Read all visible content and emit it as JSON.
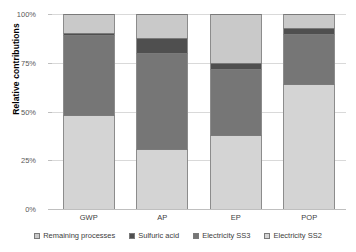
{
  "chart_data": {
    "type": "bar",
    "subtype": "stacked-100-percent",
    "title": "",
    "xlabel": "",
    "ylabel": "Relative contributions",
    "categories": [
      "GWP",
      "AP",
      "EP",
      "POP"
    ],
    "ylim": [
      0,
      100
    ],
    "y_tick_labels": [
      "0%",
      "25%",
      "50%",
      "75%",
      "100%"
    ],
    "y_tick_values": [
      0,
      25,
      50,
      75,
      100
    ],
    "grid": true,
    "legend_position": "bottom",
    "stack_order_bottom_to_top": [
      "Electricity SS2",
      "Electricity SS3",
      "Sulfuric acid",
      "Remaining processes"
    ],
    "series": [
      {
        "name": "Electricity SS2",
        "color": "#d4d4d4",
        "values": [
          48,
          31,
          38,
          64
        ]
      },
      {
        "name": "Electricity SS3",
        "color": "#767676",
        "values": [
          41,
          49,
          34,
          26
        ]
      },
      {
        "name": "Sulfuric acid",
        "color": "#4f4f4f",
        "values": [
          1.5,
          7.5,
          3,
          3
        ]
      },
      {
        "name": "Remaining processes",
        "color": "#c9c9c9",
        "values": [
          9.5,
          12.5,
          25,
          7
        ]
      }
    ]
  },
  "legend": {
    "entries": [
      {
        "label": "Remaining processes",
        "color": "#c9c9c9"
      },
      {
        "label": "Sulfuric acid",
        "color": "#4f4f4f"
      },
      {
        "label": "Electricity SS3",
        "color": "#767676"
      },
      {
        "label": "Electricity SS2",
        "color": "#d4d4d4"
      }
    ]
  },
  "colors": {
    "gridline": "#d9d9d9",
    "axis": "#bfbfbf",
    "tick_text": "#595959",
    "category_text": "#404040",
    "background": "#ffffff"
  }
}
